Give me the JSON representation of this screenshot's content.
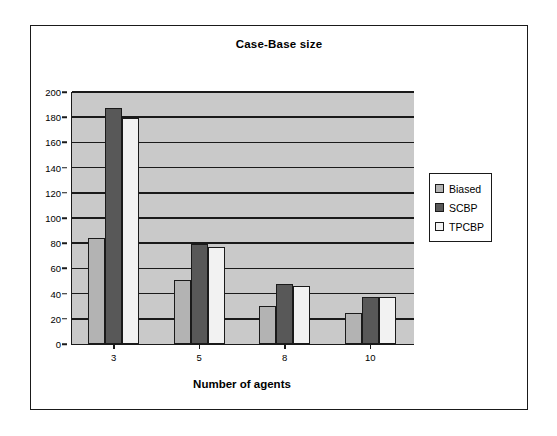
{
  "chart_data": {
    "type": "bar",
    "title": "Case-Base size",
    "xlabel": "Number of agents",
    "ylabel": "",
    "categories": [
      "3",
      "5",
      "8",
      "10"
    ],
    "series": [
      {
        "name": "Biased",
        "color": "#b3b3b3",
        "values": [
          84,
          51,
          30,
          25
        ]
      },
      {
        "name": "SCBP",
        "color": "#585858",
        "values": [
          187,
          79,
          48,
          37
        ]
      },
      {
        "name": "TPCBP",
        "color": "#f2f2f2",
        "values": [
          179,
          77,
          46,
          37
        ]
      }
    ],
    "ylim": [
      0,
      200
    ],
    "ytick_step": 20,
    "yticks": [
      "200",
      "180",
      "160",
      "140",
      "120",
      "100",
      "80",
      "60",
      "40",
      "20",
      "0"
    ],
    "grid": true,
    "legend_position": "right",
    "plot_background": "#c9c9c9",
    "axis_color": "#1a1a1a"
  },
  "legend": {
    "items": [
      {
        "label": "Biased"
      },
      {
        "label": "SCBP"
      },
      {
        "label": "TPCBP"
      }
    ]
  }
}
